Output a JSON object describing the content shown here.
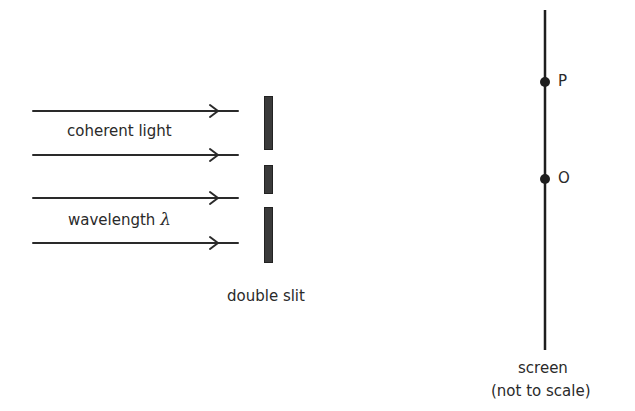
{
  "diagram": {
    "labels": {
      "light": "coherent light",
      "wavelength_prefix": "wavelength ",
      "wavelength_symbol": "λ",
      "slit": "double slit",
      "screen": "screen",
      "note": "(not to scale)",
      "point_p": "P",
      "point_o": "O"
    },
    "rays": [
      {
        "y": 111
      },
      {
        "y": 155
      },
      {
        "y": 198
      },
      {
        "y": 243
      }
    ],
    "colors": {
      "stroke": "#2a2a2a",
      "barrier": "#333333",
      "background": "#ffffff"
    }
  }
}
